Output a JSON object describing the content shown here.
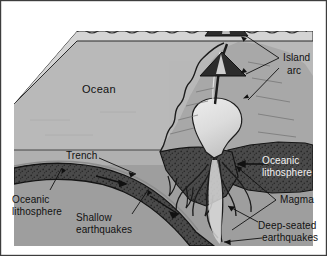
{
  "figure": {
    "type": "geological-cross-section"
  },
  "labels": {
    "ocean": "Ocean",
    "island_arc_line1": "Island",
    "island_arc_line2": "arc",
    "trench": "Trench",
    "oceanic_lithosphere_left_line1": "Oceanic",
    "oceanic_lithosphere_left_line2": "lithosphere",
    "oceanic_lithosphere_right_line1": "Oceanic",
    "oceanic_lithosphere_right_line2": "lithosphere",
    "shallow_earthquakes_line1": "Shallow",
    "shallow_earthquakes_line2": "earthquakes",
    "deep_earthquakes_line1": "Deep-seated",
    "deep_earthquakes_line2": "earthquakes",
    "magma": "Magma"
  },
  "colors": {
    "background": "#ffffff",
    "frame_border": "#3d3d3d",
    "ocean_top_face": "#d2d2d2",
    "ocean_water": "#b4b4b4",
    "upper_mantle": "#9e9e9e",
    "crust_light": "#c0c0c0",
    "lithosphere_dark": "#4a4a4a",
    "lithosphere_stipple": "#2b2b2b",
    "magma_chamber": "#e3e3e3",
    "volcano_dark": "#2e2e2e",
    "plume": "#cfcfcf",
    "line_stroke": "#1a1a1a",
    "label_dark": "#111111",
    "label_light": "#f2f2f2"
  },
  "features": [
    {
      "name": "volcanic-island-arc-emergent",
      "description": "Emergent volcano with eruption plume above sea level"
    },
    {
      "name": "volcanic-island-arc-submarine",
      "description": "Submarine volcanic cone on the overriding plate"
    },
    {
      "name": "trench",
      "description": "Deep-sea trench where the slab bends downward"
    },
    {
      "name": "subducting-slab",
      "description": "Descending oceanic lithosphere dipping to the right"
    },
    {
      "name": "magma-chamber",
      "description": "Light body of rising magma beneath the arc"
    },
    {
      "name": "magma-conduits",
      "description": "Finger-like magma pathways branching from the chamber"
    },
    {
      "name": "shallow-earthquakes",
      "description": "Seismicity along the shallow part of the slab"
    },
    {
      "name": "deep-seated-earthquakes",
      "description": "Seismicity at depth along the descending slab"
    }
  ]
}
